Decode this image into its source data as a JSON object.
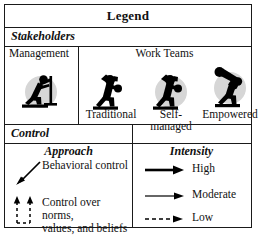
{
  "legend": {
    "title": "Legend",
    "sections": {
      "stakeholders": {
        "heading": "Stakeholders",
        "management": {
          "label": "Management",
          "icon": "management-figure-icon"
        },
        "work_teams": {
          "label": "Work Teams",
          "items": [
            {
              "label": "Traditional",
              "icon": "traditional-team-figure-icon",
              "shadow": false
            },
            {
              "label": "Self-\nmanaged",
              "icon": "self-managed-team-figure-icon",
              "shadow": true
            },
            {
              "label": "Empowered",
              "icon": "empowered-team-figure-icon",
              "shadow": true
            }
          ]
        }
      },
      "control": {
        "heading": "Control",
        "approach": {
          "title": "Approach",
          "items": [
            {
              "label": "Behavioral control",
              "icon": "diagonal-solid-arrow-icon"
            },
            {
              "label": "Control over norms,\nvalues, and beliefs",
              "icon": "vertical-dashed-arrows-icon"
            }
          ]
        },
        "intensity": {
          "title": "Intensity",
          "items": [
            {
              "label": "High",
              "icon": "thick-solid-arrow-icon"
            },
            {
              "label": "Moderate",
              "icon": "thin-solid-arrow-icon"
            },
            {
              "label": "Low",
              "icon": "dashed-arrow-icon"
            }
          ]
        }
      }
    }
  },
  "colors": {
    "border": "#1a1a1a",
    "figure": "#000000",
    "shadow": "#d6d6d6",
    "background": "#ffffff"
  }
}
